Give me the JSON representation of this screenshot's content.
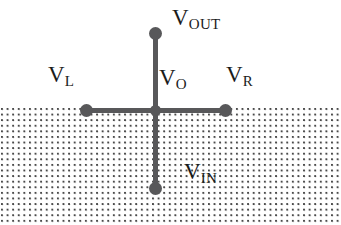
{
  "figure": {
    "kind": "circuit-node-diagram",
    "width": 341,
    "height": 225,
    "colors": {
      "background": "#ffffff",
      "wire": "#58585a",
      "node": "#58585a",
      "label_text": "#1b1b1b",
      "stipple_dot": "#4a4a4a"
    },
    "substrate": {
      "name": "stippled-region",
      "top_y": 107,
      "height": 118,
      "pattern": "dot-grid"
    },
    "junction": {
      "x": 155,
      "y": 110
    },
    "terminals": [
      {
        "name": "top-terminal",
        "x": 155,
        "y": 33
      },
      {
        "name": "left-terminal",
        "x": 86,
        "y": 110
      },
      {
        "name": "right-terminal",
        "x": 225,
        "y": 110
      },
      {
        "name": "bottom-terminal",
        "x": 155,
        "y": 188
      }
    ],
    "labels": [
      {
        "name": "v-out-label",
        "base": "V",
        "sub": "OUT",
        "x": 172,
        "y": 6
      },
      {
        "name": "v-left-label",
        "base": "V",
        "sub": "L",
        "x": 48,
        "y": 63
      },
      {
        "name": "v-o-label",
        "base": "V",
        "sub": "O",
        "x": 159,
        "y": 66
      },
      {
        "name": "v-right-label",
        "base": "V",
        "sub": "R",
        "x": 226,
        "y": 63
      },
      {
        "name": "v-in-label",
        "base": "V",
        "sub": "IN",
        "x": 184,
        "y": 160
      }
    ]
  }
}
